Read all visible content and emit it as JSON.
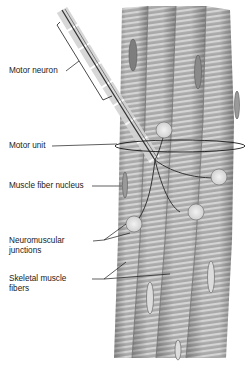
{
  "diagram": {
    "labels": {
      "motor_neuron": "Motor neuron",
      "motor_unit": "Motor unit",
      "muscle_fiber_nucleus": "Muscle fiber nucleus",
      "neuromuscular_junctions_line1": "Neuromuscular",
      "neuromuscular_junctions_line2": "junctions",
      "skeletal_muscle_fibers_line1": "Skeletal muscle",
      "skeletal_muscle_fibers_line2": "fibers"
    },
    "colors": {
      "fiber_base": "#a8a8a8",
      "fiber_stripe_light": "#d2d2d2",
      "fiber_edge": "#6e6e6e",
      "nucleus": "#8a8a8a",
      "leader_line": "#1a1a1a",
      "background": "#ffffff"
    }
  }
}
